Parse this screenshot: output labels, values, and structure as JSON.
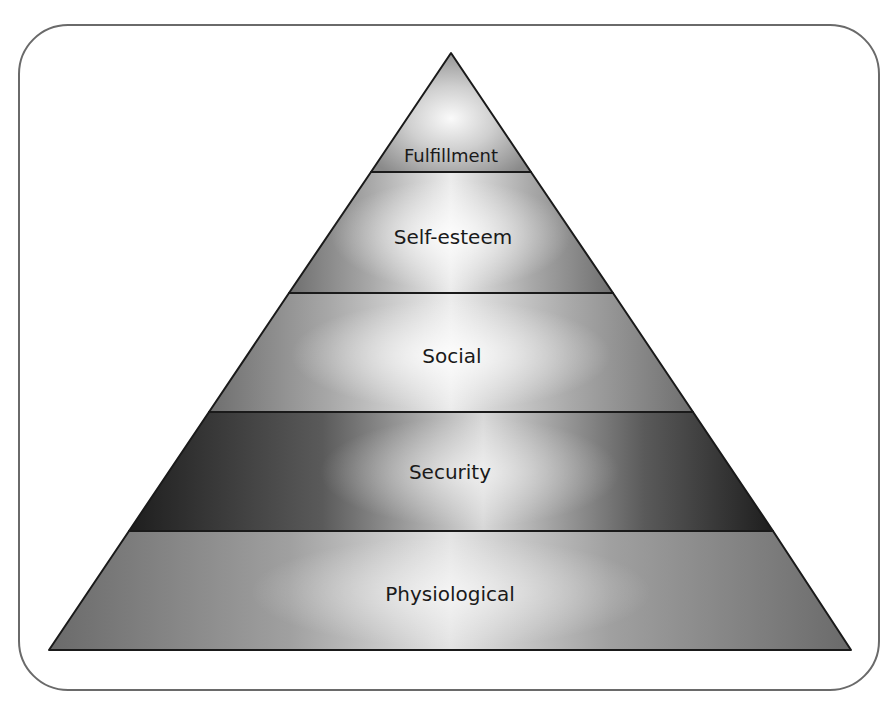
{
  "diagram": {
    "type": "pyramid",
    "levels": [
      {
        "label": "Fulfillment",
        "shade": "light"
      },
      {
        "label": "Self-esteem",
        "shade": "light"
      },
      {
        "label": "Social",
        "shade": "light"
      },
      {
        "label": "Security",
        "shade": "dark"
      },
      {
        "label": "Physiological",
        "shade": "medium"
      }
    ]
  },
  "colors": {
    "frame_border": "#6a6a6a",
    "outline": "#1a1a1a",
    "text": "#1a1a1a"
  }
}
